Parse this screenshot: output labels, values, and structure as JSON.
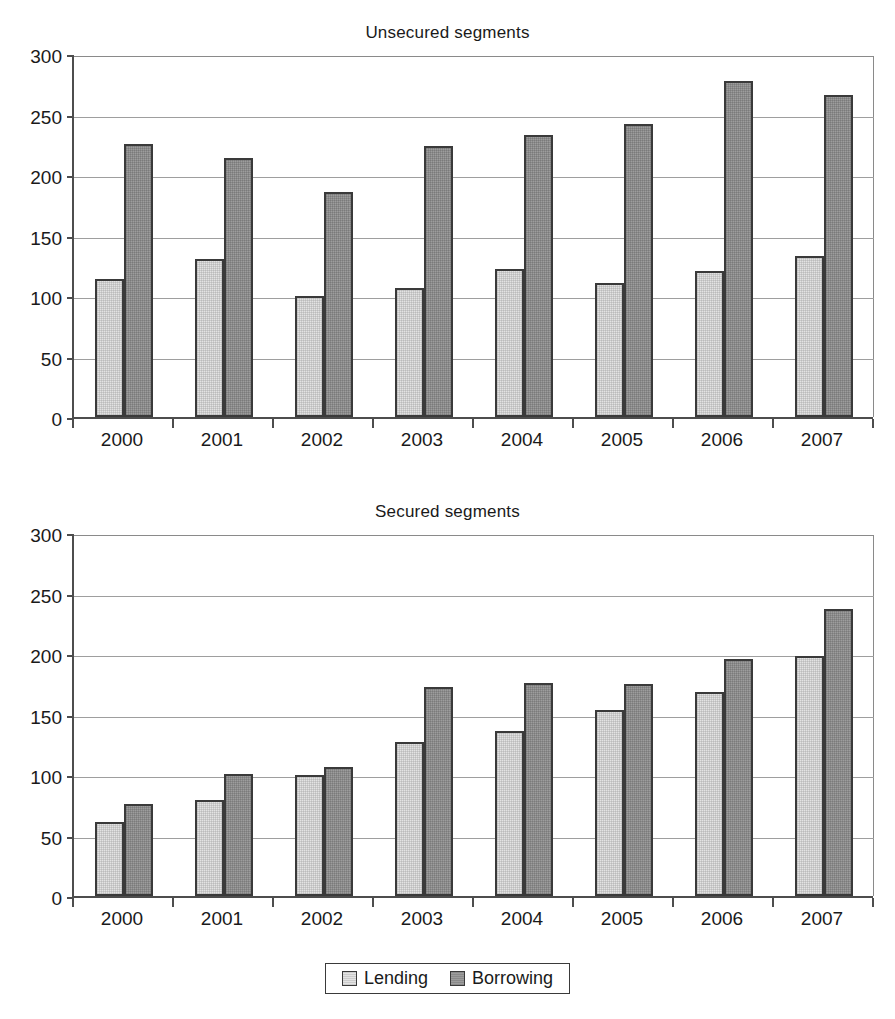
{
  "legend": {
    "items": [
      {
        "label": "Lending",
        "color": "#e3e3e3"
      },
      {
        "label": "Borrowing",
        "color": "#9d9d9d"
      }
    ]
  },
  "chart_data": [
    {
      "type": "bar",
      "title": "Unsecured segments",
      "xlabel": "",
      "ylabel": "",
      "categories": [
        "2000",
        "2001",
        "2002",
        "2003",
        "2004",
        "2005",
        "2006",
        "2007"
      ],
      "yticks": [
        0,
        50,
        100,
        150,
        200,
        250,
        300
      ],
      "ylim": [
        0,
        300
      ],
      "grid": true,
      "legend_position": "bottom-shared",
      "series": [
        {
          "name": "Lending",
          "color": "#e3e3e3",
          "values": [
            114,
            131,
            100,
            107,
            122,
            111,
            121,
            133
          ]
        },
        {
          "name": "Borrowing",
          "color": "#9d9d9d",
          "values": [
            226,
            214,
            186,
            224,
            233,
            242,
            278,
            266
          ]
        }
      ]
    },
    {
      "type": "bar",
      "title": "Secured segments",
      "xlabel": "",
      "ylabel": "",
      "categories": [
        "2000",
        "2001",
        "2002",
        "2003",
        "2004",
        "2005",
        "2006",
        "2007"
      ],
      "yticks": [
        0,
        50,
        100,
        150,
        200,
        250,
        300
      ],
      "ylim": [
        0,
        300
      ],
      "grid": true,
      "legend_position": "bottom-shared",
      "series": [
        {
          "name": "Lending",
          "color": "#e3e3e3",
          "values": [
            61,
            79,
            100,
            127,
            136,
            154,
            169,
            198
          ]
        },
        {
          "name": "Borrowing",
          "color": "#9d9d9d",
          "values": [
            76,
            101,
            107,
            173,
            176,
            175,
            196,
            237
          ]
        }
      ]
    }
  ]
}
